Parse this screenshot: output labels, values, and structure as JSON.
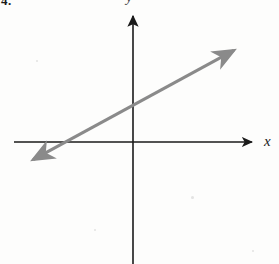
{
  "figure": {
    "problem_number": "4.",
    "background_color": "#fdfdfc",
    "axis_color": "#1a1a1a",
    "line_color": "#8a8a8a",
    "x_axis_label": "x",
    "y_axis_label": "y"
  },
  "chart_data": {
    "type": "line",
    "title": "",
    "subtitle": "",
    "xlabel": "x",
    "ylabel": "y",
    "grid": false,
    "legend": null,
    "axis_style": {
      "x_axis_arrow": "right",
      "y_axis_arrow": "up",
      "tick_labels": false,
      "origin_marked": false
    },
    "origin_px": [
      133,
      142
    ],
    "xlim_px": [
      14,
      258
    ],
    "ylim_px": [
      10,
      264
    ],
    "series": [
      {
        "name": "line",
        "type": "line",
        "color": "#8a8a8a",
        "arrows": "both",
        "slope": 0.53,
        "y_intercept_px": 34,
        "x_intercept_px": -66,
        "endpoints_px": [
          [
            27,
            163
          ],
          [
            240,
            47
          ]
        ],
        "points_px": [
          [
            27,
            163
          ],
          [
            67,
            142
          ],
          [
            133,
            108
          ],
          [
            240,
            47
          ]
        ]
      }
    ]
  },
  "speckles": [
    {
      "x": 191,
      "y": 196,
      "size": 3
    },
    {
      "x": 94,
      "y": 229,
      "size": 2
    },
    {
      "x": 252,
      "y": 250,
      "size": 2
    },
    {
      "x": 36,
      "y": 60,
      "size": 2
    }
  ]
}
